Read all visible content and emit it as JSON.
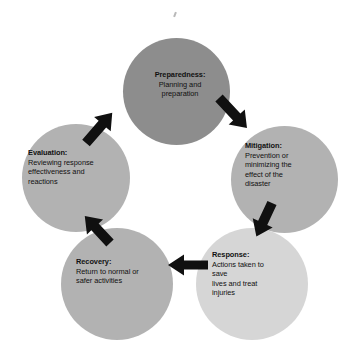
{
  "diagram": {
    "type": "cyclic-process",
    "background_color": "#ffffff",
    "arrow_color": "#101010",
    "nodes": [
      {
        "id": "preparedness",
        "title": "Preparedness:",
        "description": "Planning and preparation",
        "lines": [
          "Planning and",
          "preparation"
        ],
        "fill_color": "#8d8d8d",
        "position": "top"
      },
      {
        "id": "mitigation",
        "title": "Mitigation:",
        "description": "Prevention or minimizing the effect of the disaster",
        "lines": [
          "Prevention or",
          "minimizing the",
          "effect of the",
          "disaster"
        ],
        "fill_color": "#b2b2b2",
        "position": "right"
      },
      {
        "id": "response",
        "title": "Response:",
        "description": "Actions taken to save lives and treat injuries",
        "lines": [
          "Actions taken to",
          "save",
          "lives and treat",
          "injuries"
        ],
        "fill_color": "#d6d6d6",
        "position": "bottom-right"
      },
      {
        "id": "recovery",
        "title": "Recovery:",
        "description": "Return to normal or safer activities",
        "lines": [
          "Return to normal or",
          "safer activities"
        ],
        "fill_color": "#b2b2b2",
        "position": "bottom-left"
      },
      {
        "id": "evaluation",
        "title": "Evaluation:",
        "description": "Reviewing response effectiveness and reactions",
        "lines": [
          "Reviewing response",
          "effectiveness and",
          "reactions"
        ],
        "fill_color": "#b2b2b2",
        "position": "left"
      }
    ],
    "arrows": [
      {
        "id": "preparedness-to-mitigation",
        "from": "preparedness",
        "to": "mitigation",
        "direction": "down-right"
      },
      {
        "id": "mitigation-to-response",
        "from": "mitigation",
        "to": "response",
        "direction": "down-left"
      },
      {
        "id": "response-to-recovery",
        "from": "response",
        "to": "recovery",
        "direction": "left"
      },
      {
        "id": "recovery-to-evaluation",
        "from": "recovery",
        "to": "evaluation",
        "direction": "up-left"
      },
      {
        "id": "evaluation-to-preparedness",
        "from": "evaluation",
        "to": "preparedness",
        "direction": "up-right"
      }
    ]
  }
}
